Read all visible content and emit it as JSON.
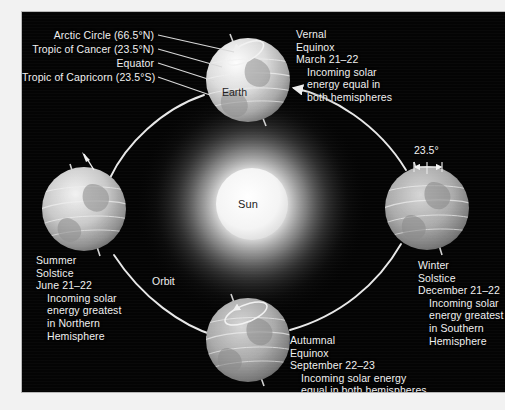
{
  "figure": {
    "background_color": "#040404",
    "text_color": "#f0f0f0",
    "page_color": "#ffffff"
  },
  "sun": {
    "label": "Sun",
    "color": "#ffffff",
    "glow_color": "#d8d8d8"
  },
  "orbit": {
    "label": "Orbit",
    "direction": "counterclockwise as drawn (left to bottom to right to top)",
    "line_color": "#e8e8e8"
  },
  "earth_labels": {
    "main": "Earth",
    "lines": [
      {
        "id": "arctic-circle",
        "text": "Arctic Circle (66.5°N)"
      },
      {
        "id": "tropic-of-cancer",
        "text": "Tropic of Cancer (23.5°N)"
      },
      {
        "id": "equator",
        "text": "Equator"
      },
      {
        "id": "tropic-of-capricorn",
        "text": "Tropic of Capricorn (23.5°S)"
      }
    ]
  },
  "tilt": {
    "value": "23.5°"
  },
  "positions": [
    {
      "id": "vernal-equinox",
      "name": "Vernal",
      "name2": "Equinox",
      "date": "March 21–22",
      "detail": [
        "Incoming solar",
        "energy equal in",
        "both hemispheres"
      ]
    },
    {
      "id": "summer-solstice",
      "name": "Summer",
      "name2": "Solstice",
      "date": "June 21–22",
      "detail": [
        "Incoming solar",
        "energy greatest",
        "in Northern",
        "Hemisphere"
      ]
    },
    {
      "id": "autumnal-equinox",
      "name": "Autumnal",
      "name2": "Equinox",
      "date": "September 22–23",
      "detail": [
        "Incoming solar energy",
        "equal in both hemispheres"
      ]
    },
    {
      "id": "winter-solstice",
      "name": "Winter",
      "name2": "Solstice",
      "date": "December 21–22",
      "detail": [
        "Incoming solar",
        "energy greatest",
        "in Southern",
        "Hemisphere"
      ]
    }
  ]
}
